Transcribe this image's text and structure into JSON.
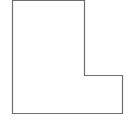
{
  "diagram": {
    "shape": "L-polygon",
    "stroke": "#6e6e6e",
    "fill": "#ffffff",
    "points": "12.5,0.5 84.5,0.5 84.5,75.5 122.5,75.5 122.5,113.5 12.5,113.5"
  }
}
